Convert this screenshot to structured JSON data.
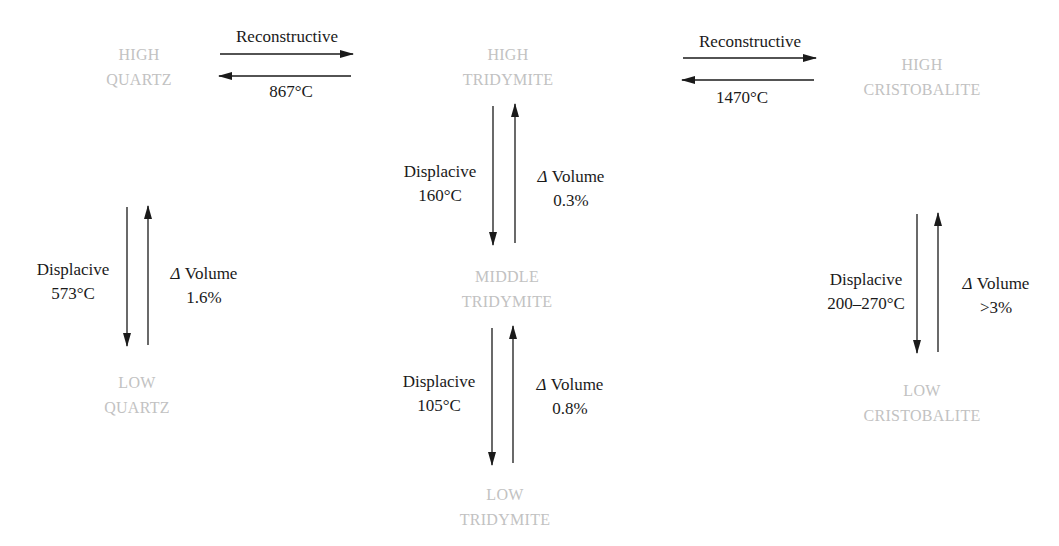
{
  "diagram": {
    "title": "",
    "colors": {
      "phase_text": "#c2c2c2",
      "label_text": "#1a1a1a",
      "arrow": "#1a1a1a"
    },
    "phases": {
      "high_quartz": {
        "line1": "HIGH",
        "line2": "QUARTZ"
      },
      "low_quartz": {
        "line1": "LOW",
        "line2": "QUARTZ"
      },
      "high_tridymite": {
        "line1": "HIGH",
        "line2": "TRIDYMITE"
      },
      "middle_tridymite": {
        "line1": "MIDDLE",
        "line2": "TRIDYMITE"
      },
      "low_tridymite": {
        "line1": "LOW",
        "line2": "TRIDYMITE"
      },
      "high_cristobalite": {
        "line1": "HIGH",
        "line2": "CRISTOBALITE"
      },
      "low_cristobalite": {
        "line1": "LOW",
        "line2": "CRISTOBALITE"
      }
    },
    "transitions": {
      "quartz_to_tridymite": {
        "type": "Reconstructive",
        "temperature": "867°C"
      },
      "tridymite_to_cristobalite": {
        "type": "Reconstructive",
        "temperature": "1470°C"
      },
      "quartz_high_low": {
        "type": "Displacive",
        "temperature": "573°C",
        "delta_symbol": "Δ",
        "volume_label": "Volume",
        "volume_change": "1.6%"
      },
      "tridymite_high_middle": {
        "type": "Displacive",
        "temperature": "160°C",
        "delta_symbol": "Δ",
        "volume_label": "Volume",
        "volume_change": "0.3%"
      },
      "tridymite_middle_low": {
        "type": "Displacive",
        "temperature": "105°C",
        "delta_symbol": "Δ",
        "volume_label": "Volume",
        "volume_change": "0.8%"
      },
      "cristobalite_high_low": {
        "type": "Displacive",
        "temperature": "200–270°C",
        "delta_symbol": "Δ",
        "volume_label": "Volume",
        "volume_change": ">3%"
      }
    }
  }
}
